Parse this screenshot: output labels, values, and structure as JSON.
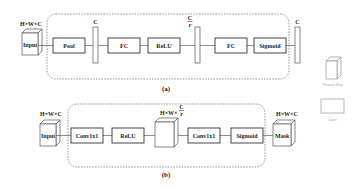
{
  "diagram_a": {
    "caption": "(a)",
    "input_dim": "H×W×C",
    "input_label": "Input",
    "bar1_label": "C",
    "bar2_num": "C",
    "bar2_den": "r",
    "bar3_label": "C",
    "blocks": [
      "Pool",
      "FC",
      "ReLU",
      "FC",
      "Sigmoid"
    ]
  },
  "diagram_b": {
    "caption": "(b)",
    "input_dim": "H×W×C",
    "input_label": "Input",
    "mid_dim": "H×W×",
    "mid_num": "C",
    "mid_den": "r",
    "output_dim": "H×W×C",
    "output_label": "Mask",
    "blocks": [
      "Conv1x1",
      "ReLU",
      "Conv1x1",
      "Sigmoid"
    ]
  },
  "legend": {
    "feature_map_label": "Feature Map",
    "layer_label": "Layer"
  }
}
